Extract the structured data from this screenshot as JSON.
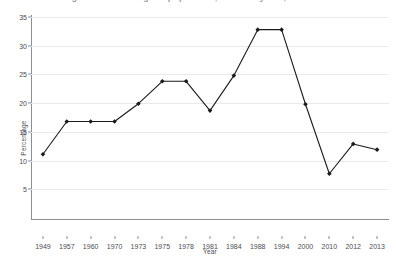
{
  "chart_data": {
    "type": "line",
    "title": "Figure 1. Percentage of population, selected years, 1949-2013",
    "xlabel": "Year",
    "ylabel": "Percentage",
    "categories": [
      "1949",
      "1957",
      "1960",
      "1970",
      "1973",
      "1975",
      "1978",
      "1981",
      "1984",
      "1988",
      "1994",
      "2000",
      "2010",
      "2012",
      "2013"
    ],
    "values": [
      11.1,
      16.8,
      16.8,
      16.8,
      19.9,
      23.8,
      23.8,
      18.7,
      24.8,
      32.8,
      32.8,
      19.8,
      7.7,
      12.9,
      11.9
    ],
    "series": [
      {
        "name": "Percentage",
        "values": [
          11.1,
          16.8,
          16.8,
          16.8,
          19.9,
          23.8,
          23.8,
          18.7,
          24.8,
          32.8,
          32.8,
          19.8,
          7.7,
          12.9,
          11.9
        ]
      }
    ],
    "ylim": [
      0,
      35
    ],
    "yticks": [
      5,
      10,
      15,
      20,
      25,
      30,
      35
    ],
    "ytick_labels": [
      "5",
      "10",
      "15",
      "20",
      "25",
      "30",
      "35"
    ],
    "grid": true,
    "grid_axis": "y",
    "legend": false,
    "legend_position": "none",
    "marker": "diamond",
    "line_color": "#1a1a1a",
    "marker_color": "#1a1a1a",
    "gridline_color": "#e9e9ef",
    "axis_color": "#8d8d95",
    "background_color": "#ffffff"
  },
  "axes": {
    "y_title": "Percentage",
    "x_title": "Year"
  }
}
